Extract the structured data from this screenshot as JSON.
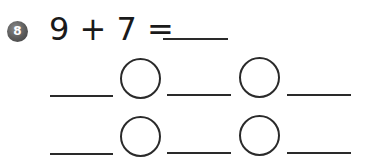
{
  "problem": {
    "number": "8",
    "equation": "9 + 7 = ",
    "operand_a": "9",
    "operator": "+",
    "operand_b": "7",
    "equals": "=",
    "answer": ""
  },
  "work_rows": [
    {
      "blanks": [
        "",
        "",
        ""
      ],
      "operators": [
        "",
        ""
      ]
    },
    {
      "blanks": [
        "",
        "",
        ""
      ],
      "operators": [
        "",
        ""
      ]
    }
  ],
  "colors": {
    "badge": "#5a5a5a",
    "ink": "#2a2a2a"
  }
}
